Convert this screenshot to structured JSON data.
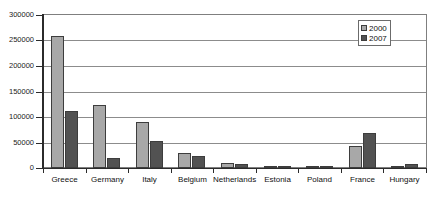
{
  "chart_data": {
    "type": "bar",
    "title": "",
    "subtitle": "",
    "xlabel": "",
    "ylabel": "",
    "ylim": [
      0,
      300000
    ],
    "ytick_step": 50000,
    "yticks": [
      "300000",
      "250000",
      "200000",
      "150000",
      "100000",
      "50000",
      "0"
    ],
    "ytick_values": [
      300000,
      250000,
      200000,
      150000,
      100000,
      50000,
      0
    ],
    "grid": true,
    "grid_axis": "y",
    "legend_position": "top-right",
    "categories": [
      "Greece",
      "Germany",
      "Italy",
      "Belgium",
      "Netherlands",
      "Estonia",
      "Poland",
      "France",
      "Hungary"
    ],
    "series": [
      {
        "name": "2000",
        "color": "#a8a8a8",
        "values": [
          258000,
          124000,
          91000,
          29000,
          9000,
          2500,
          1000,
          43000,
          3000
        ]
      },
      {
        "name": "2007",
        "color": "#525252",
        "values": [
          112000,
          19000,
          53000,
          23000,
          8000,
          1000,
          4000,
          69000,
          8000
        ]
      }
    ]
  },
  "legend": {
    "items": [
      {
        "label": "2000",
        "swatch": "s2000"
      },
      {
        "label": "2007",
        "swatch": "s2007"
      }
    ]
  },
  "colors": {
    "series_2000": "#a8a8a8",
    "series_2007": "#525252",
    "grid": "#8c8c8c",
    "axis": "#2b2b2b",
    "background": "#ffffff"
  }
}
